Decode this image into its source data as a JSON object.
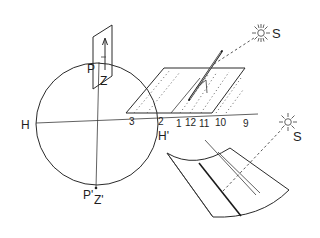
{
  "diagram": {
    "labels": {
      "H": "H",
      "H_prime": "H'",
      "P": "P",
      "Z": "Z",
      "P_prime": "P'",
      "Z_prime": "Z'",
      "sun_top": "S",
      "sun_bottom": "S"
    },
    "hour_marks": [
      "3",
      "2",
      "1",
      "12",
      "11",
      "10",
      "9"
    ],
    "colors": {
      "line": "#2a2a2a",
      "background": "#ffffff"
    }
  }
}
